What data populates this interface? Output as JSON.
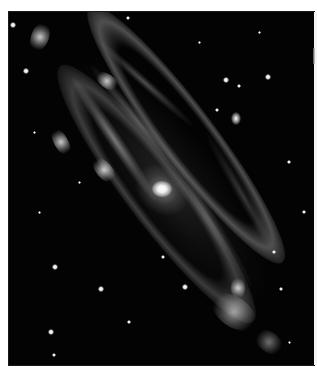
{
  "image": {
    "subject": "spiral galaxy (Andromeda-like), grayscale",
    "background_color": "#ffffff",
    "sky_color": "#030303",
    "frame": {
      "left": 9,
      "top": 12,
      "width": 305,
      "height": 353
    },
    "core": {
      "x": 152,
      "y": 177
    },
    "satellite_galaxy": {
      "x": 227,
      "y": 106
    },
    "stars": [
      {
        "x": 4,
        "y": 13,
        "r": 2.2
      },
      {
        "x": 119,
        "y": 6,
        "r": 1.6
      },
      {
        "x": 17,
        "y": 59,
        "r": 1.8
      },
      {
        "x": 217,
        "y": 68,
        "r": 2.0
      },
      {
        "x": 230,
        "y": 74,
        "r": 1.6
      },
      {
        "x": 259,
        "y": 65,
        "r": 1.8
      },
      {
        "x": 208,
        "y": 98,
        "r": 1.4
      },
      {
        "x": 46,
        "y": 255,
        "r": 2.0
      },
      {
        "x": 92,
        "y": 277,
        "r": 1.8
      },
      {
        "x": 42,
        "y": 320,
        "r": 2.2
      },
      {
        "x": 45,
        "y": 343,
        "r": 1.4
      },
      {
        "x": 176,
        "y": 275,
        "r": 2.0
      },
      {
        "x": 272,
        "y": 277,
        "r": 1.6
      },
      {
        "x": 154,
        "y": 245,
        "r": 1.6
      },
      {
        "x": 280,
        "y": 150,
        "r": 1.2
      },
      {
        "x": 295,
        "y": 200,
        "r": 1.2
      },
      {
        "x": 70,
        "y": 170,
        "r": 1.0
      },
      {
        "x": 30,
        "y": 200,
        "r": 1.0
      },
      {
        "x": 250,
        "y": 20,
        "r": 1.0
      },
      {
        "x": 190,
        "y": 30,
        "r": 1.0
      },
      {
        "x": 120,
        "y": 310,
        "r": 1.2
      },
      {
        "x": 280,
        "y": 330,
        "r": 1.0
      },
      {
        "x": 25,
        "y": 120,
        "r": 1.0
      },
      {
        "x": 265,
        "y": 240,
        "r": 1.2
      }
    ]
  }
}
